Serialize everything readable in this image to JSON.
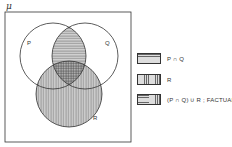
{
  "diagram": {
    "universe_label": "μ",
    "sets": [
      {
        "name": "P",
        "label": "P"
      },
      {
        "name": "Q",
        "label": "Q"
      },
      {
        "name": "R",
        "label": "R"
      }
    ]
  },
  "legend": [
    {
      "pattern": "horizontal-lines",
      "label": "P ∩ Q"
    },
    {
      "pattern": "vertical-lines",
      "label": "R"
    },
    {
      "pattern": "combined",
      "label": "(P ∩ Q) ∪ R ; FACTUAL."
    }
  ],
  "colors": {
    "line": "#333333",
    "fill": "#bdbdbd",
    "background": "#ffffff"
  }
}
